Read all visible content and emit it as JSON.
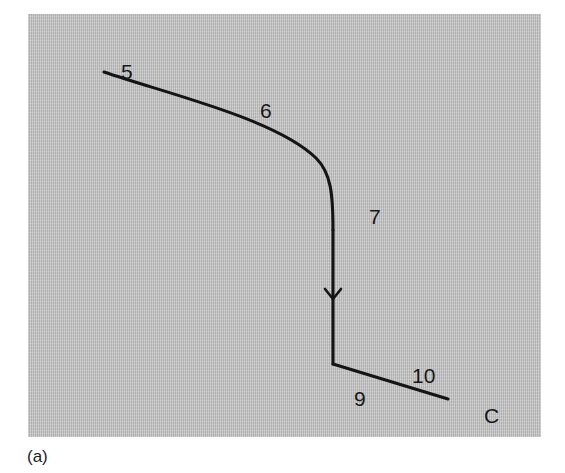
{
  "figure": {
    "caption": "(a)",
    "background_color": "#bfbfbf",
    "page_color": "#ffffff",
    "stroke_color": "#141414",
    "panel": {
      "x": 28,
      "y": 14,
      "width": 513,
      "height": 423
    }
  },
  "diagram": {
    "type": "node-link-path",
    "nodes": [
      {
        "id": "5",
        "label": "5",
        "x": 100,
        "y": 58,
        "kind": "endpoint-label"
      },
      {
        "id": "6",
        "label": "6",
        "x": 240,
        "y": 97,
        "kind": "segment-label"
      },
      {
        "id": "7",
        "label": "7",
        "x": 348,
        "y": 203,
        "kind": "segment-label"
      },
      {
        "id": "9",
        "label": "9",
        "x": 333,
        "y": 385,
        "kind": "vertex-label"
      },
      {
        "id": "10",
        "label": "10",
        "x": 395,
        "y": 362,
        "kind": "segment-label"
      },
      {
        "id": "C",
        "label": "C",
        "x": 465,
        "y": 402,
        "kind": "endpoint-label"
      }
    ],
    "segments": [
      {
        "name": "curve-5-to-7",
        "label": "6",
        "type": "curve",
        "start": [
          104,
          72
        ],
        "end": [
          333,
          230
        ],
        "control_points": [
          [
            196,
            104
          ],
          [
            300,
            140
          ],
          [
            333,
            195
          ]
        ]
      },
      {
        "name": "vertical-7-to-9",
        "label": "7",
        "type": "line",
        "start": [
          333,
          230
        ],
        "end": [
          333,
          364
        ],
        "arrow": {
          "direction": "down",
          "tip_x": 333,
          "tip_y": 299
        }
      },
      {
        "name": "line-9-to-C",
        "label": "10",
        "type": "line",
        "start": [
          333,
          364
        ],
        "end": [
          448,
          399
        ]
      }
    ],
    "arrows": [
      {
        "name": "flow-arrow",
        "x": 333,
        "y": 299,
        "direction": "down"
      }
    ]
  },
  "labels": {
    "n5": "5",
    "n6": "6",
    "n7": "7",
    "n9": "9",
    "n10": "10",
    "nC": "C",
    "caption": "(a)"
  }
}
